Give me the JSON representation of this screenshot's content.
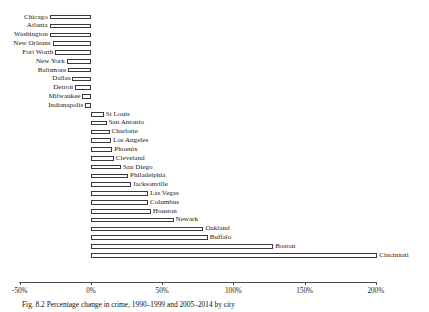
{
  "chart_data": {
    "type": "bar",
    "orientation": "horizontal",
    "title": "",
    "xlabel": "",
    "ylabel": "",
    "xlim": [
      -50,
      200
    ],
    "xticks": [
      -50,
      0,
      50,
      100,
      150,
      200
    ],
    "xtick_labels": [
      "-50%",
      "0%",
      "50%",
      "100%",
      "150%",
      "200%"
    ],
    "grid": false,
    "legend": false,
    "bar_fill": "#ffffff",
    "bar_edge": "#3a3a3a",
    "categories": [
      "Chicago",
      "Atlanta",
      "Washington",
      "New Orleans",
      "Fort Worth",
      "New York",
      "Baltimore",
      "Dallas",
      "Detroit",
      "Milwaukee",
      "Indianapolis",
      "St Louis",
      "San Antonio",
      "Charlotte",
      "Los Angeles",
      "Phoenix",
      "Cleveland",
      "San Diego",
      "Philadelphia",
      "Jacksonville",
      "Las Vegas",
      "Columbus",
      "Houston",
      "Newark",
      "Oakland",
      "Buffalo",
      "Boston",
      "Cincinnati"
    ],
    "values": [
      -29,
      -29,
      -29,
      -27,
      -25,
      -17,
      -16,
      -13,
      -11,
      -6,
      -4,
      9,
      11,
      13,
      14,
      15,
      16,
      21,
      26,
      28,
      40,
      40,
      42,
      58,
      79,
      82,
      128,
      201
    ]
  },
  "caption": {
    "text": "Fig. 8.2   Percentage change in crime, 1990–1999 and 2005–2014 by city"
  }
}
